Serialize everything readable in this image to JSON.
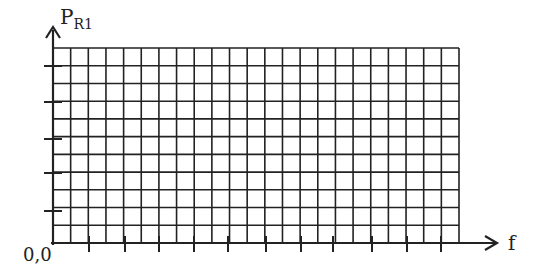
{
  "diagram": {
    "y_axis_label": "P",
    "y_axis_subscript": "R1",
    "x_axis_label": "f",
    "origin_label": "0,0",
    "grid": {
      "x0": 53,
      "y0": 48,
      "x1": 459,
      "y1": 243,
      "columns": 23,
      "rows": 11
    },
    "x_ticks": [
      89,
      125,
      159,
      194,
      228,
      266,
      301,
      333,
      372,
      407,
      441
    ],
    "y_ticks": [
      66,
      102,
      139,
      173,
      211
    ],
    "line_color": "#222222"
  }
}
